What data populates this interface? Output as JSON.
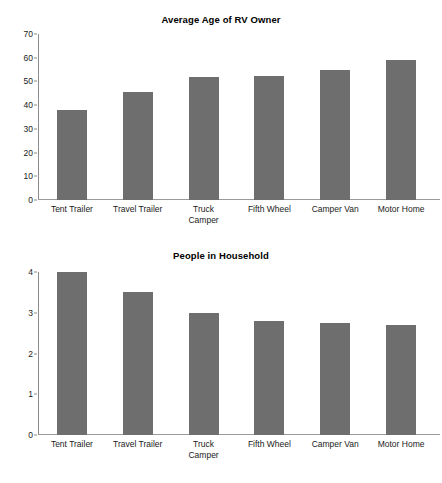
{
  "page": {
    "background": "#ffffff",
    "bar_color": "#6e6e6e",
    "axis_color": "#8c8c8c"
  },
  "chart_data": [
    {
      "type": "bar",
      "title": "Average Age of RV Owner",
      "xlabel": "",
      "ylabel": "",
      "categories": [
        "Tent Trailer",
        "Travel Trailer",
        "Truck Camper",
        "Fifth Wheel",
        "Camper Van",
        "Motor Home"
      ],
      "category_lines": [
        [
          "Tent Trailer"
        ],
        [
          "Travel Trailer"
        ],
        [
          "Truck",
          "Camper"
        ],
        [
          "Fifth Wheel"
        ],
        [
          "Camper Van"
        ],
        [
          "Motor Home"
        ]
      ],
      "values": [
        38,
        45.5,
        52,
        52.5,
        55,
        59
      ],
      "ylim": [
        0,
        70
      ],
      "yticks": [
        0,
        10,
        20,
        30,
        40,
        50,
        60,
        70
      ],
      "ytick_labels": [
        "0",
        "10",
        "20",
        "30",
        "40",
        "50",
        "60",
        "70"
      ],
      "grid": false,
      "legend": false
    },
    {
      "type": "bar",
      "title": "People in Household",
      "xlabel": "",
      "ylabel": "",
      "categories": [
        "Tent Trailer",
        "Travel Trailer",
        "Truck Camper",
        "Fifth Wheel",
        "Camper Van",
        "Motor Home"
      ],
      "category_lines": [
        [
          "Tent Trailer"
        ],
        [
          "Travel Trailer"
        ],
        [
          "Truck",
          "Camper"
        ],
        [
          "Fifth Wheel"
        ],
        [
          "Camper Van"
        ],
        [
          "Motor Home"
        ]
      ],
      "values": [
        4.0,
        3.5,
        3.0,
        2.8,
        2.75,
        2.7
      ],
      "ylim": [
        0,
        4
      ],
      "yticks": [
        0,
        1,
        2,
        3,
        4
      ],
      "ytick_labels": [
        "0",
        "1",
        "2",
        "3",
        "4"
      ],
      "grid": false,
      "legend": false
    }
  ]
}
